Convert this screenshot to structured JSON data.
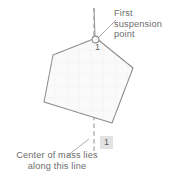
{
  "figure": {
    "kind": "physics-diagram",
    "title_text": "Center of mass determination by suspension",
    "background_color": "#ffffff"
  },
  "annotations": {
    "first_suspension_point": "First\nsuspension\npoint",
    "center_of_mass": "Center of mass lies\nalong this line"
  },
  "labels": {
    "step_top": "1",
    "step_bottom": "1"
  },
  "colors": {
    "text": "#6d6d6d",
    "outline": "#8a8a8a",
    "shape_fill": "#fafafa",
    "plumb_line": "#9a9a9a",
    "badge_background": "#e2e2e2",
    "badge_text": "#5d5d5d"
  },
  "geometry": {
    "shape_name": "irregular-pentagon",
    "vertices": "96,38 53,55 44,102 112,123 133,68",
    "suspension_point": {
      "x": 96,
      "y": 38,
      "radius": 3.4
    },
    "plumb_line": {
      "x": 94,
      "y_top": 8,
      "y_bottom": 152
    },
    "leader_top": "116,20 98,37",
    "leader_bottom": "67,156 88,139"
  }
}
